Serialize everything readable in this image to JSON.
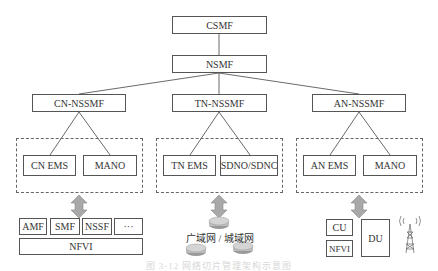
{
  "top": {
    "csmf": "CSMF",
    "nsmf": "NSMF"
  },
  "domains": [
    {
      "name": "CN-NSSMF",
      "systems": [
        "CN EMS",
        "MANO"
      ]
    },
    {
      "name": "TN-NSSMF",
      "systems": [
        "TN EMS",
        "SDNO/SDNC"
      ]
    },
    {
      "name": "AN-NSSMF",
      "systems": [
        "AN EMS",
        "MANO"
      ]
    }
  ],
  "core_network": {
    "functions": [
      "AMF",
      "SMF",
      "NSSF",
      "···"
    ],
    "infra": "NFVI"
  },
  "transport_network": {
    "label": "广域网 / 城域网",
    "icon": "router-icon"
  },
  "access_network": {
    "cu": "CU",
    "nfvi": "NFVI",
    "du": "DU",
    "icon": "cell-tower-icon"
  },
  "caption": "图 3-12  网络切片管理架构示意图"
}
